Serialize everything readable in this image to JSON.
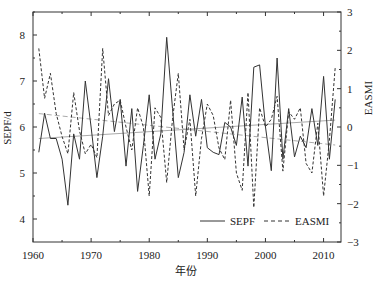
{
  "chart_data": {
    "type": "line",
    "title": "",
    "xlabel": "年份",
    "ylabel": "SEPF/d",
    "ylabel_right": "EASMI",
    "xlim": [
      1960,
      2013
    ],
    "ylim": [
      3.5,
      8.5
    ],
    "ylim_right": [
      -3,
      3
    ],
    "x_ticks": [
      1960,
      1970,
      1980,
      1990,
      2000,
      2010
    ],
    "y_ticks": [
      4,
      5,
      6,
      7,
      8
    ],
    "y_ticks_right": [
      -3,
      -2,
      -1,
      0,
      1,
      2,
      3
    ],
    "grid": false,
    "legend_position": "lower right",
    "x": [
      1961,
      1962,
      1963,
      1964,
      1965,
      1966,
      1967,
      1968,
      1969,
      1970,
      1971,
      1972,
      1973,
      1974,
      1975,
      1976,
      1977,
      1978,
      1979,
      1980,
      1981,
      1982,
      1983,
      1984,
      1985,
      1986,
      1987,
      1988,
      1989,
      1990,
      1991,
      1992,
      1993,
      1994,
      1995,
      1996,
      1997,
      1998,
      1999,
      2000,
      2001,
      2002,
      2003,
      2004,
      2005,
      2006,
      2007,
      2008,
      2009,
      2010,
      2011,
      2012
    ],
    "series": [
      {
        "name": "SEPF",
        "axis": "left",
        "style": "solid",
        "color": "#333333",
        "values": [
          5.45,
          6.3,
          5.75,
          5.75,
          5.3,
          4.3,
          5.85,
          5.3,
          7.0,
          6.0,
          4.9,
          5.8,
          7.05,
          5.9,
          6.6,
          5.15,
          6.4,
          4.6,
          5.6,
          6.7,
          5.3,
          5.85,
          7.95,
          6.4,
          4.9,
          5.45,
          6.7,
          5.8,
          6.6,
          5.55,
          5.45,
          5.4,
          6.1,
          6.0,
          5.6,
          6.65,
          5.15,
          7.3,
          7.35,
          6.0,
          5.05,
          7.5,
          5.3,
          6.4,
          5.35,
          5.8,
          5.55,
          6.4,
          5.6,
          7.1,
          5.3,
          6.6
        ]
      },
      {
        "name": "EASMI",
        "axis": "right",
        "style": "dashed",
        "color": "#333333",
        "values": [
          2.05,
          0.75,
          1.4,
          0.35,
          -0.25,
          -0.7,
          0.9,
          -0.1,
          -0.7,
          -0.45,
          -0.8,
          2.05,
          0.3,
          0.6,
          0.7,
          0.0,
          -0.6,
          0.5,
          0.0,
          -1.8,
          0.5,
          0.25,
          -1.45,
          0.2,
          1.4,
          -0.6,
          0.2,
          -1.8,
          -0.3,
          0.6,
          0.3,
          -0.55,
          -0.85,
          0.7,
          -1.2,
          -1.65,
          0.9,
          -2.1,
          0.5,
          0.0,
          0.2,
          0.8,
          -1.15,
          0.4,
          0.2,
          0.5,
          -0.95,
          -1.2,
          0.1,
          -1.8,
          -0.35,
          1.55
        ]
      }
    ],
    "trend_lines": [
      {
        "name": "SEPF trend",
        "axis": "left",
        "style": "solid",
        "color": "#aaaaaa",
        "x": [
          1961,
          2012
        ],
        "y": [
          5.75,
          6.15
        ]
      },
      {
        "name": "EASMI trend",
        "axis": "right",
        "style": "dashed",
        "color": "#aaaaaa",
        "x": [
          1961,
          2012
        ],
        "y": [
          0.35,
          -0.47
        ]
      }
    ]
  },
  "legend": {
    "items": [
      {
        "label": "SEPF",
        "style": "solid"
      },
      {
        "label": "EASMI",
        "style": "dashed"
      }
    ]
  }
}
